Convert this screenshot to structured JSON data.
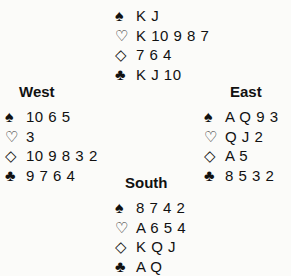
{
  "suit_symbols": {
    "spades": "♠",
    "hearts": "♡",
    "diamonds": "◇",
    "clubs": "♣"
  },
  "hands": {
    "north": {
      "label": "",
      "spades": "K J",
      "hearts": "K 10 9 8 7",
      "diamonds": "7 6 4",
      "clubs": "K J 10"
    },
    "west": {
      "label": "West",
      "spades": "10 6 5",
      "hearts": "3",
      "diamonds": "10 9 8 3 2",
      "clubs": "9 7 6 4"
    },
    "east": {
      "label": "East",
      "spades": "A Q 9 3",
      "hearts": "Q J 2",
      "diamonds": "A 5",
      "clubs": "8 5 3 2"
    },
    "south": {
      "label": "South",
      "spades": "8 7 4 2",
      "hearts": "A 6 5 4",
      "diamonds": "K Q J",
      "clubs": "A Q"
    }
  }
}
